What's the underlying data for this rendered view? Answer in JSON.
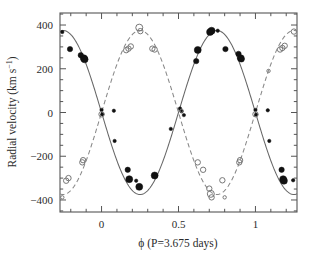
{
  "figure": {
    "background": "#ffffff",
    "frame_color": "#555555",
    "plot_box": {
      "left": 60,
      "top": 13,
      "right": 297,
      "bottom": 212
    }
  },
  "axes": {
    "x": {
      "label_parts": {
        "symbol": "ϕ",
        "rest": " (P=3.675 days)"
      },
      "label": "ϕ (P=3.675 days)",
      "ticks": [
        0,
        0.5,
        1
      ],
      "tick_labels": [
        "0",
        "0.5",
        "1"
      ],
      "minor_tick_step": 0.1,
      "range": [
        -0.27,
        1.27
      ]
    },
    "y": {
      "label_parts": {
        "main": "Radial velocity (km s",
        "sup": "−1",
        "tail": ")"
      },
      "label": "Radial velocity (km s−1)",
      "ticks": [
        -400,
        -200,
        0,
        200,
        400
      ],
      "tick_labels": [
        "−400",
        "−200",
        "0",
        "200",
        "400"
      ],
      "minor_tick_step": 50,
      "range": [
        -455,
        455
      ]
    }
  },
  "chart_data": {
    "type": "scatter",
    "title": "",
    "xlabel": "ϕ (P=3.675 days)",
    "ylabel": "Radial velocity (km s−1)",
    "xlim": [
      -0.27,
      1.27
    ],
    "ylim": [
      -455,
      455
    ],
    "grid": false,
    "legend": "none",
    "series": [
      {
        "name": "Primary (filled circles)",
        "marker": "filled-circle",
        "color": "#111111",
        "curve_style": "solid",
        "curve_color": "#666666",
        "model": {
          "form": "A*cos(2*pi*(phi-phi0))",
          "amplitude": 375,
          "offset": 0,
          "phase_of_max": 0.75
        },
        "points": [
          {
            "x": -0.255,
            "y": 368,
            "size": "small"
          },
          {
            "x": -0.205,
            "y": 290,
            "size": "medium"
          },
          {
            "x": -0.135,
            "y": 262,
            "size": "medium"
          },
          {
            "x": -0.115,
            "y": 248,
            "size": "large"
          },
          {
            "x": -0.11,
            "y": 243,
            "size": "large"
          },
          {
            "x": 0.0,
            "y": 12,
            "size": "small"
          },
          {
            "x": 0.005,
            "y": -8,
            "size": "small"
          },
          {
            "x": 0.08,
            "y": 8,
            "size": "small"
          },
          {
            "x": 0.085,
            "y": -130,
            "size": "small"
          },
          {
            "x": 0.17,
            "y": -262,
            "size": "medium"
          },
          {
            "x": 0.18,
            "y": -305,
            "size": "large"
          },
          {
            "x": 0.225,
            "y": -312,
            "size": "small"
          },
          {
            "x": 0.245,
            "y": -340,
            "size": "large"
          },
          {
            "x": 0.345,
            "y": -288,
            "size": "large"
          },
          {
            "x": 0.45,
            "y": -75,
            "size": "small"
          },
          {
            "x": 0.51,
            "y": 18,
            "size": "small"
          },
          {
            "x": 0.52,
            "y": 5,
            "size": "small"
          },
          {
            "x": 0.535,
            "y": -12,
            "size": "small"
          },
          {
            "x": 0.615,
            "y": 235,
            "size": "medium"
          },
          {
            "x": 0.625,
            "y": 286,
            "size": "large"
          },
          {
            "x": 0.705,
            "y": 368,
            "size": "large"
          },
          {
            "x": 0.715,
            "y": 374,
            "size": "large"
          },
          {
            "x": 0.755,
            "y": 374,
            "size": "small"
          },
          {
            "x": 0.805,
            "y": 290,
            "size": "medium"
          },
          {
            "x": 0.89,
            "y": 268,
            "size": "medium"
          },
          {
            "x": 0.905,
            "y": 248,
            "size": "large"
          },
          {
            "x": 0.91,
            "y": 243,
            "size": "medium"
          },
          {
            "x": 1.0,
            "y": 12,
            "size": "small"
          },
          {
            "x": 1.005,
            "y": -10,
            "size": "small"
          },
          {
            "x": 1.08,
            "y": 10,
            "size": "small"
          },
          {
            "x": 1.09,
            "y": -130,
            "size": "small"
          },
          {
            "x": 1.17,
            "y": -262,
            "size": "medium"
          },
          {
            "x": 1.18,
            "y": -305,
            "size": "large"
          },
          {
            "x": 1.185,
            "y": -312,
            "size": "large"
          },
          {
            "x": 1.245,
            "y": -310,
            "size": "small"
          }
        ]
      },
      {
        "name": "Secondary (open circles)",
        "marker": "open-circle",
        "color": "#777777",
        "curve_style": "dashed",
        "curve_color": "#888888",
        "model": {
          "form": "A*cos(2*pi*(phi-phi0))",
          "amplitude": 375,
          "offset": 0,
          "phase_of_max": 0.25
        },
        "points": [
          {
            "x": -0.255,
            "y": -388,
            "size": "small"
          },
          {
            "x": -0.23,
            "y": -312,
            "size": "medium"
          },
          {
            "x": -0.215,
            "y": -300,
            "size": "medium"
          },
          {
            "x": -0.125,
            "y": -228,
            "size": "medium"
          },
          {
            "x": -0.12,
            "y": -218,
            "size": "medium"
          },
          {
            "x": 0.0,
            "y": -8,
            "size": "medium"
          },
          {
            "x": 0.16,
            "y": 285,
            "size": "medium"
          },
          {
            "x": 0.175,
            "y": 292,
            "size": "medium"
          },
          {
            "x": 0.19,
            "y": 302,
            "size": "medium"
          },
          {
            "x": 0.245,
            "y": 388,
            "size": "large"
          },
          {
            "x": 0.252,
            "y": 372,
            "size": "medium"
          },
          {
            "x": 0.33,
            "y": 292,
            "size": "medium"
          },
          {
            "x": 0.345,
            "y": 288,
            "size": "medium"
          },
          {
            "x": 0.52,
            "y": 8,
            "size": "small"
          },
          {
            "x": 0.625,
            "y": -228,
            "size": "medium"
          },
          {
            "x": 0.66,
            "y": -262,
            "size": "medium"
          },
          {
            "x": 0.7,
            "y": -348,
            "size": "medium"
          },
          {
            "x": 0.71,
            "y": -372,
            "size": "large"
          },
          {
            "x": 0.715,
            "y": -388,
            "size": "medium"
          },
          {
            "x": 0.785,
            "y": -310,
            "size": "medium"
          },
          {
            "x": 0.8,
            "y": -388,
            "size": "small"
          },
          {
            "x": 0.895,
            "y": -228,
            "size": "medium"
          },
          {
            "x": 0.9,
            "y": -218,
            "size": "medium"
          },
          {
            "x": 1.0,
            "y": -8,
            "size": "medium"
          },
          {
            "x": 1.085,
            "y": 190,
            "size": "small"
          },
          {
            "x": 1.16,
            "y": 288,
            "size": "medium"
          },
          {
            "x": 1.175,
            "y": 295,
            "size": "medium"
          },
          {
            "x": 1.19,
            "y": 305,
            "size": "medium"
          },
          {
            "x": 1.25,
            "y": 370,
            "size": "medium"
          }
        ]
      }
    ]
  }
}
